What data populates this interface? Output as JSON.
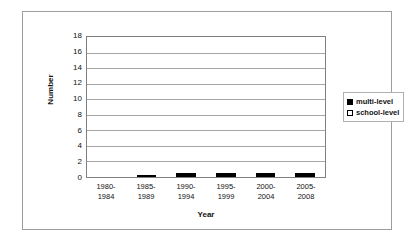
{
  "chart_data": {
    "type": "bar",
    "subtype": "stacked-vertical",
    "title": "",
    "xlabel": "Year",
    "ylabel": "Number",
    "ylim": [
      0,
      18
    ],
    "ytick_step": 2,
    "yticks": [
      "18",
      "16",
      "14",
      "12",
      "10",
      "8",
      "6",
      "4",
      "2",
      "0"
    ],
    "grid": true,
    "grid_axis": "y",
    "legend_position": "right",
    "categories": [
      "1980-1984",
      "1985-1989",
      "1990-1994",
      "1995-1999",
      "2000-2004",
      "2005-2008"
    ],
    "category_lines": [
      [
        "1980-",
        "1984"
      ],
      [
        "1985-",
        "1989"
      ],
      [
        "1990-",
        "1994"
      ],
      [
        "1995-",
        "1999"
      ],
      [
        "2000-",
        "2004"
      ],
      [
        "2005-",
        "2008"
      ]
    ],
    "series": [
      {
        "name": "school-level",
        "color": "#ffffff",
        "values": [
          0,
          2,
          1,
          1,
          3,
          3
        ]
      },
      {
        "name": "multi-level",
        "color": "#000000",
        "values": [
          0,
          0,
          1,
          1,
          13,
          10
        ]
      }
    ],
    "totals": [
      0,
      2,
      2,
      2,
      16,
      13
    ]
  },
  "legend": {
    "items": [
      {
        "label": "multi-level",
        "swatch": "filled-square-swatch",
        "color": "#000000"
      },
      {
        "label": "school-level",
        "swatch": "empty-square-swatch",
        "color": "#ffffff"
      }
    ]
  }
}
